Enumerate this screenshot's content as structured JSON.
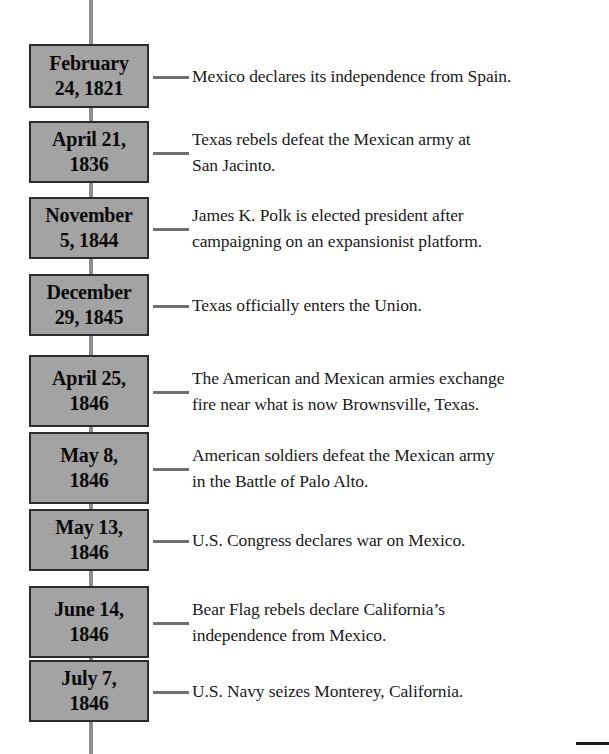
{
  "colors": {
    "box_fill": "#a3a3a3",
    "box_border": "#2b2b2b",
    "spine": "#8e8e8e",
    "connector": "#707070",
    "text": "#1a1a1a"
  },
  "timeline": {
    "events": [
      {
        "date_lines": [
          "February",
          "24, 1821"
        ],
        "date": "February 24, 1821",
        "description_lines": [
          "Mexico declares its independence from Spain."
        ],
        "description": "Mexico declares its independence from Spain."
      },
      {
        "date_lines": [
          "April 21,",
          "1836"
        ],
        "date": "April 21, 1836",
        "description_lines": [
          "Texas rebels defeat the Mexican army at",
          "San Jacinto."
        ],
        "description": "Texas rebels defeat the Mexican army at San Jacinto."
      },
      {
        "date_lines": [
          "November",
          "5, 1844"
        ],
        "date": "November 5, 1844",
        "description_lines": [
          "James K. Polk is elected president after",
          "campaigning on an expansionist platform."
        ],
        "description": "James K. Polk is elected president after campaigning on an expansionist platform."
      },
      {
        "date_lines": [
          "December",
          "29, 1845"
        ],
        "date": "December 29, 1845",
        "description_lines": [
          "Texas officially enters the Union."
        ],
        "description": "Texas officially enters the Union."
      },
      {
        "date_lines": [
          "April 25,",
          "1846"
        ],
        "date": "April 25, 1846",
        "description_lines": [
          "The American and Mexican armies exchange",
          "fire near what is now Brownsville, Texas."
        ],
        "description": "The American and Mexican armies exchange fire near what is now Brownsville, Texas."
      },
      {
        "date_lines": [
          "May 8,",
          "1846"
        ],
        "date": "May 8, 1846",
        "description_lines": [
          "American soldiers defeat the Mexican army",
          "in the Battle of Palo Alto."
        ],
        "description": "American soldiers defeat the Mexican army in the Battle of Palo Alto."
      },
      {
        "date_lines": [
          "May 13,",
          "1846"
        ],
        "date": "May 13, 1846",
        "description_lines": [
          "U.S. Congress declares war on Mexico."
        ],
        "description": "U.S. Congress declares war on Mexico."
      },
      {
        "date_lines": [
          "June 14,",
          "1846"
        ],
        "date": "June 14, 1846",
        "description_lines": [
          "Bear Flag rebels declare California’s",
          "independence from Mexico."
        ],
        "description": "Bear Flag rebels declare California’s independence from Mexico."
      },
      {
        "date_lines": [
          "July 7,",
          "1846"
        ],
        "date": "July 7, 1846",
        "description_lines": [
          "U.S. Navy seizes Monterey, California."
        ],
        "description": "U.S. Navy seizes Monterey, California."
      }
    ]
  },
  "layout": {
    "box_tops": [
      44,
      121,
      197,
      274,
      355,
      432,
      509,
      586,
      660
    ],
    "box_heights": [
      64,
      62,
      62,
      62,
      72,
      72,
      62,
      72,
      62
    ]
  }
}
